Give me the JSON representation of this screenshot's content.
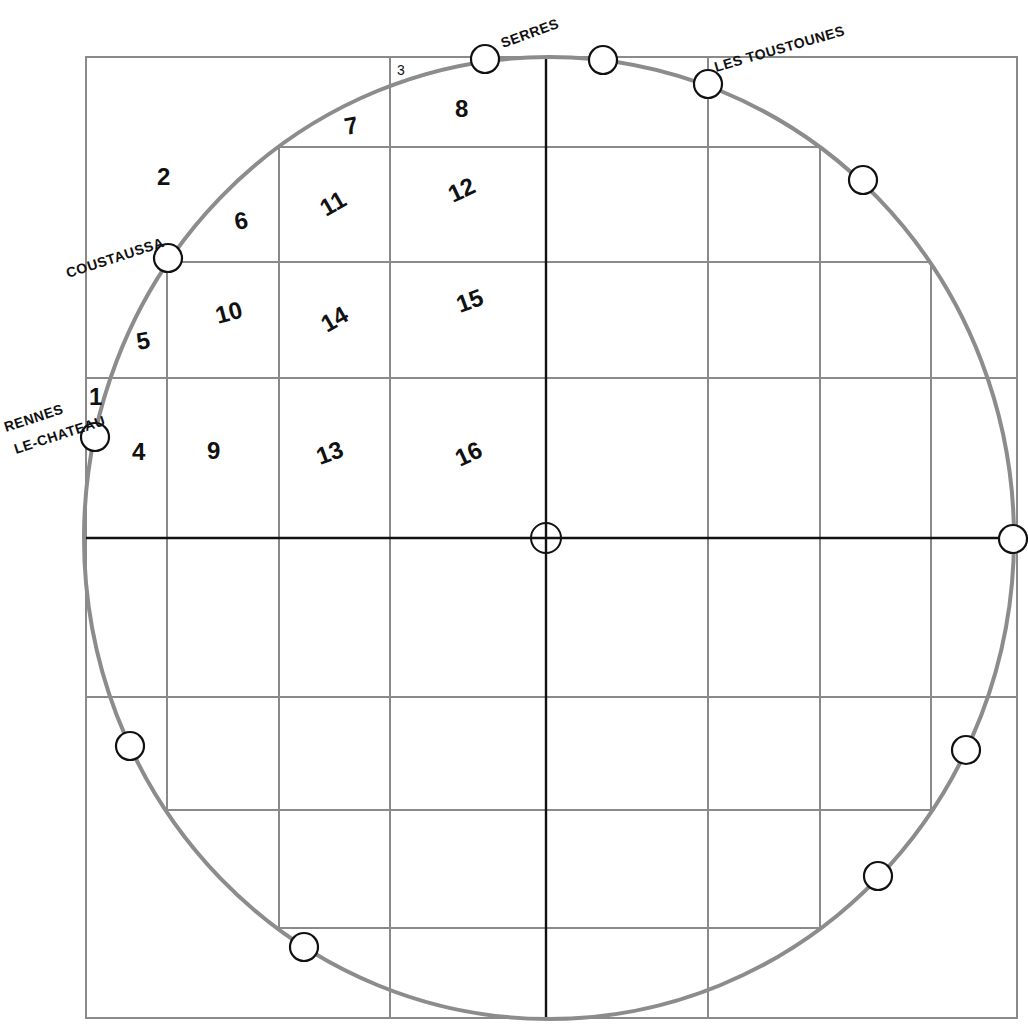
{
  "map": {
    "frame": {
      "x1": 86,
      "y1": 57,
      "x2": 1017,
      "y2": 1018
    },
    "center": {
      "x": 546,
      "y": 538
    },
    "ring": {
      "cx": 549,
      "cy": 538,
      "rx": 465,
      "ry": 481,
      "color": "#8c8c8c"
    },
    "grid_color": "#8a8a8a",
    "axis_color": "#111111",
    "horizontal_lines": [
      {
        "y": 147,
        "x1": 279,
        "x2": 820
      },
      {
        "y": 262,
        "x1": 167,
        "x2": 931
      },
      {
        "y": 378,
        "x1": 86,
        "x2": 1017
      },
      {
        "y": 697,
        "x1": 86,
        "x2": 1017
      },
      {
        "y": 810,
        "x1": 167,
        "x2": 931
      },
      {
        "y": 928,
        "x1": 279,
        "x2": 820
      }
    ],
    "vertical_lines": [
      {
        "x": 167,
        "y1": 262,
        "y2": 810
      },
      {
        "x": 279,
        "y1": 147,
        "y2": 928
      },
      {
        "x": 390,
        "y1": 57,
        "y2": 1018
      },
      {
        "x": 708,
        "y1": 57,
        "y2": 1018
      },
      {
        "x": 820,
        "y1": 147,
        "y2": 928
      },
      {
        "x": 931,
        "y1": 262,
        "y2": 810
      }
    ],
    "axes": {
      "horizontal": {
        "y": 538,
        "x1": 86,
        "x2": 1014
      },
      "vertical": {
        "x": 546,
        "y1": 57,
        "y2": 1018
      }
    },
    "places": [
      {
        "name": "SERRES",
        "x": 503,
        "y": 48,
        "rotate": -20,
        "marker": {
          "x": 485,
          "y": 59
        }
      },
      {
        "name": "LES TOUSTOUNES",
        "x": 716,
        "y": 72,
        "rotate": -16,
        "marker": {
          "x": 708,
          "y": 84
        }
      },
      {
        "name": "COUSTAUSSA",
        "x": 68,
        "y": 278,
        "rotate": -18,
        "marker": {
          "x": 168,
          "y": 258
        }
      },
      {
        "name": "RENNES",
        "x": 6,
        "y": 432,
        "rotate": -18,
        "marker": null
      },
      {
        "name": "LE-CHATEAU",
        "x": 16,
        "y": 454,
        "rotate": -18,
        "marker": {
          "x": 95,
          "y": 437
        }
      }
    ],
    "unlabeled_markers": [
      {
        "x": 603,
        "y": 60
      },
      {
        "x": 863,
        "y": 180
      },
      {
        "x": 1013,
        "y": 539
      },
      {
        "x": 966,
        "y": 750
      },
      {
        "x": 878,
        "y": 876
      },
      {
        "x": 304,
        "y": 947
      },
      {
        "x": 130,
        "y": 746
      }
    ],
    "center_marker": {
      "x": 546,
      "y": 538
    },
    "cells": [
      {
        "label": "1",
        "x": 89,
        "y": 405,
        "rotate": 0,
        "size": "normal"
      },
      {
        "label": "2",
        "x": 157,
        "y": 185,
        "rotate": 0,
        "size": "normal"
      },
      {
        "label": "3",
        "x": 397,
        "y": 75,
        "rotate": 0,
        "size": "small"
      },
      {
        "label": "4",
        "x": 132,
        "y": 460,
        "rotate": 0,
        "size": "normal"
      },
      {
        "label": "5",
        "x": 138,
        "y": 350,
        "rotate": -10,
        "size": "normal"
      },
      {
        "label": "6",
        "x": 236,
        "y": 230,
        "rotate": -10,
        "size": "normal"
      },
      {
        "label": "7",
        "x": 346,
        "y": 135,
        "rotate": -10,
        "size": "normal"
      },
      {
        "label": "8",
        "x": 455,
        "y": 117,
        "rotate": 0,
        "size": "normal"
      },
      {
        "label": "9",
        "x": 207,
        "y": 459,
        "rotate": 0,
        "size": "normal"
      },
      {
        "label": "10",
        "x": 218,
        "y": 324,
        "rotate": -15,
        "size": "normal"
      },
      {
        "label": "11",
        "x": 326,
        "y": 217,
        "rotate": -30,
        "size": "normal"
      },
      {
        "label": "12",
        "x": 453,
        "y": 203,
        "rotate": -25,
        "size": "normal"
      },
      {
        "label": "13",
        "x": 320,
        "y": 465,
        "rotate": -20,
        "size": "normal"
      },
      {
        "label": "14",
        "x": 327,
        "y": 333,
        "rotate": -30,
        "size": "normal"
      },
      {
        "label": "15",
        "x": 460,
        "y": 313,
        "rotate": -20,
        "size": "normal"
      },
      {
        "label": "16",
        "x": 460,
        "y": 467,
        "rotate": -25,
        "size": "normal"
      }
    ]
  }
}
